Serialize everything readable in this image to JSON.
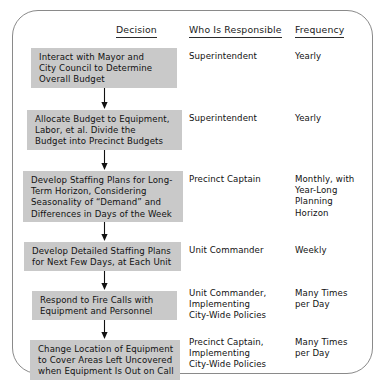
{
  "diagram": {
    "title_columns": {
      "decision": "Decision",
      "who": "Who Is Responsible",
      "frequency": "Frequency"
    },
    "accent_box_color": "#c9c9c9",
    "frame_color": "#8a8a8a",
    "rows": [
      {
        "decision": "Interact with Mayor and\nCity Council to Determine\nOverall Budget",
        "who": "Superintendent",
        "frequency": "Yearly"
      },
      {
        "decision": "Allocate Budget to Equipment,\nLabor, et al.  Divide the\nBudget into Precinct Budgets",
        "who": "Superintendent",
        "frequency": "Yearly"
      },
      {
        "decision": "Develop Staffing Plans for Long-\nTerm Horizon, Considering\nSeasonality of “Demand” and\nDifferences in Days of the Week",
        "who": "Precinct Captain",
        "frequency": "Monthly, with\nYear-Long\nPlanning\nHorizon"
      },
      {
        "decision": "Develop Detailed Staffing Plans\nfor Next Few Days, at Each Unit",
        "who": "Unit Commander",
        "frequency": "Weekly"
      },
      {
        "decision": "Respond to Fire Calls with\nEquipment and Personnel",
        "who": "Unit Commander,\nImplementing\nCity-Wide Policies",
        "frequency": "Many Times\nper Day"
      },
      {
        "decision": "Change Location of Equipment\nto Cover Areas Left Uncovered\nwhen Equipment Is Out on Call",
        "who": "Precinct Captain,\nImplementing\nCity-Wide Policies",
        "frequency": "Many Times\nper Day"
      }
    ],
    "connectors": [
      {
        "name": "arrow-row1-to-row2"
      },
      {
        "name": "arrow-row2-to-row3"
      },
      {
        "name": "arrow-row3-to-row4"
      },
      {
        "name": "arrow-row4-to-row5"
      },
      {
        "name": "arrow-row5-to-row6"
      }
    ]
  }
}
